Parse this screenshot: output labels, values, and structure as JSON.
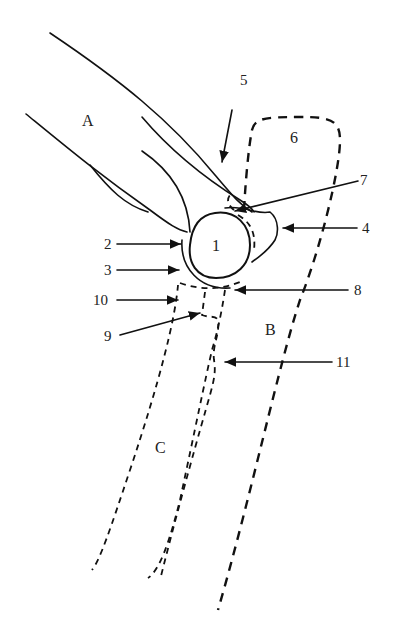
{
  "diagram": {
    "regions": {
      "A": "A",
      "B": "B",
      "C": "C"
    },
    "numbers": [
      "1",
      "2",
      "3",
      "4",
      "5",
      "6",
      "7",
      "8",
      "9",
      "10",
      "11"
    ],
    "colors": {
      "line": "#111111",
      "background": "#ffffff"
    }
  }
}
